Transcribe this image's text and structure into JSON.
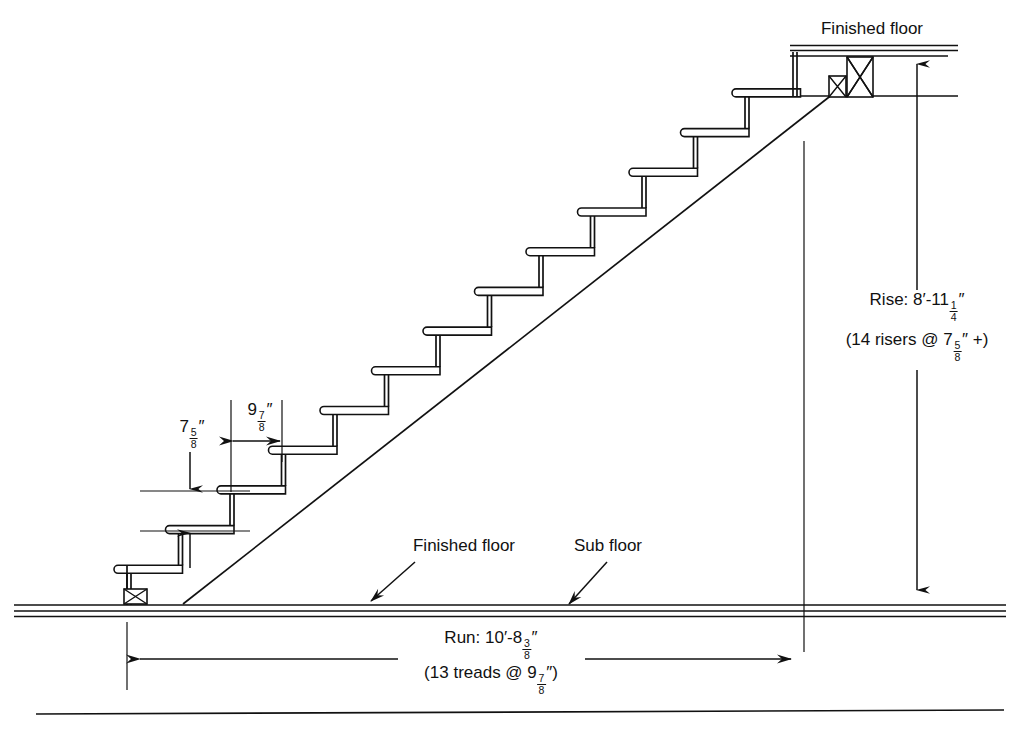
{
  "labels": {
    "upper_finished_floor": "Finished floor",
    "lower_finished_floor": "Finished floor",
    "sub_floor": "Sub floor"
  },
  "dimensions": {
    "riser": {
      "label": "riser-height",
      "whole": "7",
      "num": "5",
      "den": "8",
      "unit": "″"
    },
    "tread": {
      "label": "tread-depth",
      "whole": "9",
      "num": "7",
      "den": "8",
      "unit": "″"
    },
    "rise": {
      "prefix": "Rise: 8′-11",
      "num": "1",
      "den": "4",
      "unit": "″",
      "note_prefix": "(14 risers @ 7",
      "note_num": "5",
      "note_den": "8",
      "note_suffix": "″ +)"
    },
    "run": {
      "prefix": "Run: 10′-8",
      "num": "3",
      "den": "8",
      "unit": "″",
      "note_prefix": "(13 treads @ 9",
      "note_num": "7",
      "note_den": "8",
      "note_suffix": "″)"
    }
  },
  "chart_data": {
    "type": "diagram",
    "total_rise_inches": 107.25,
    "total_run_inches": 128.375,
    "riser_count": 14,
    "riser_height_inches": 7.625,
    "tread_count": 13,
    "tread_depth_inches": 9.875,
    "geometry": {
      "base_x": 127,
      "base_y": 605,
      "tread_dx": 51.5,
      "riser_dy": 39.7,
      "steps": 13,
      "nosing_overhang": 13,
      "tread_thickness": 8,
      "floor_lines_y": [
        605,
        611,
        616
      ],
      "upper_floor_lines_y": [
        48,
        96
      ],
      "rise_dim_x": 917,
      "run_dim_y": 659,
      "bottom_rule_y": 712
    }
  }
}
